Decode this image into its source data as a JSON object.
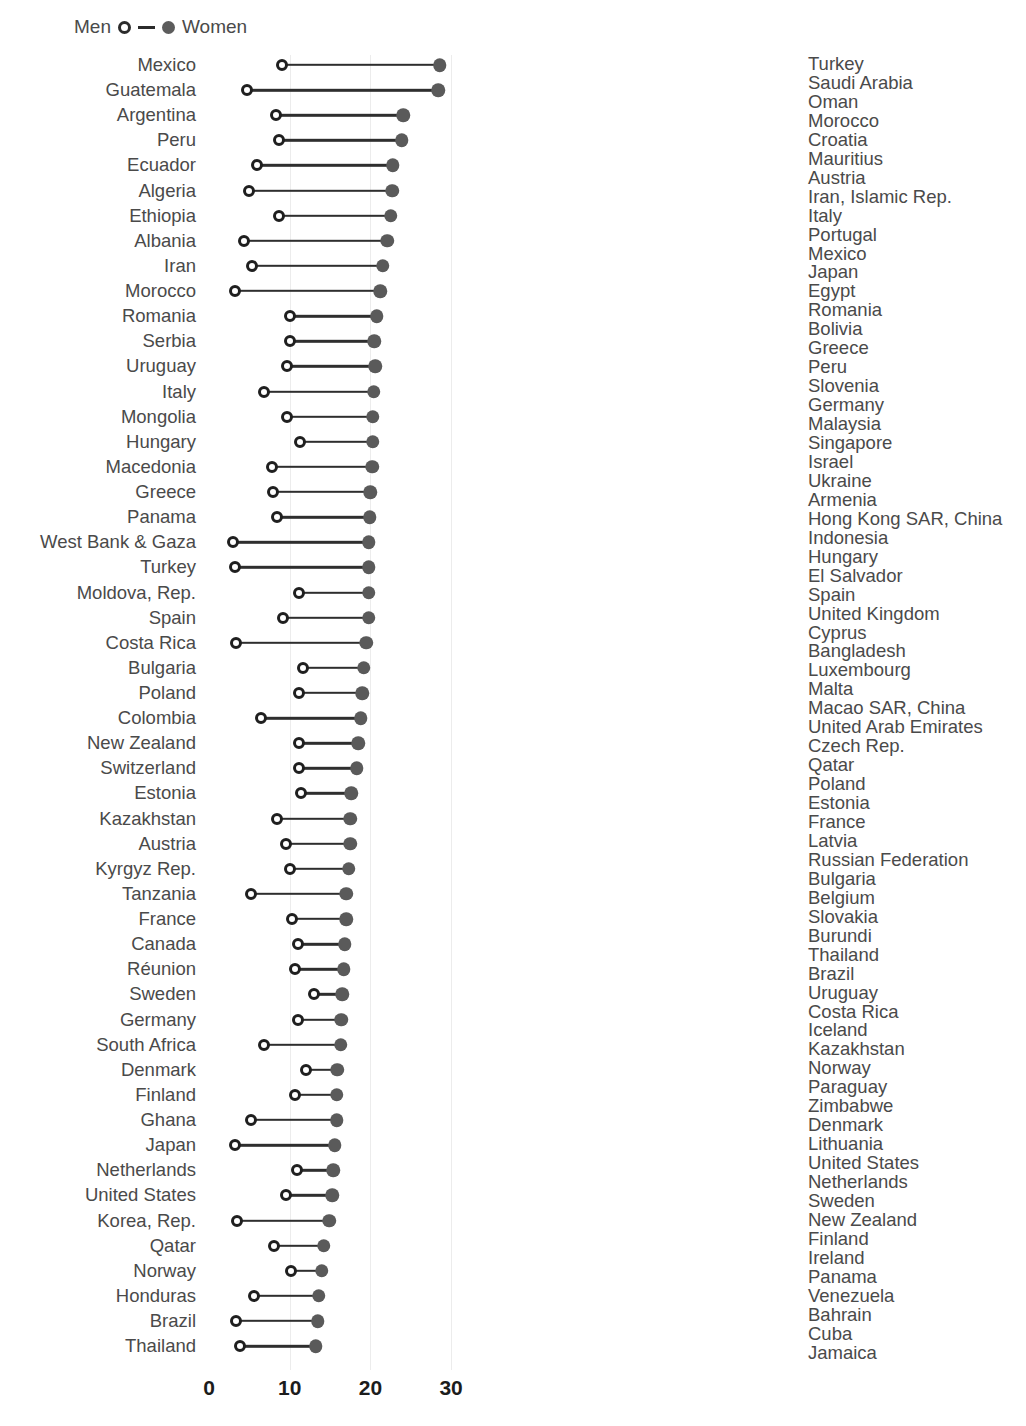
{
  "legend": {
    "men_label": "Men",
    "women_label": "Women",
    "men_icon": "open-circle-icon",
    "women_icon": "filled-circle-icon"
  },
  "colors": {
    "dot_men": "#FFFFFF",
    "dot_men_stroke": "#1F1F1F",
    "dot_women": "#5A5A5A",
    "connector": "#2E2E2E",
    "bar": "#454545",
    "grid": "#ECECEC",
    "text": "#4A4A4A",
    "axis_text": "#1C1C1C",
    "background": "#FFFFFF"
  },
  "chart_data": [
    {
      "id": "dumbbell",
      "type": "scatter",
      "subtype": "dumbbell",
      "title": "",
      "xlabel": "",
      "ylabel": "",
      "xlim": [
        0,
        34
      ],
      "xticks": [
        0,
        10,
        20,
        30
      ],
      "xticklabels": [
        "0",
        "10",
        "20",
        "30"
      ],
      "grid": true,
      "legend": [
        "Men",
        "Women"
      ],
      "legend_position": "top-left",
      "categories": [
        "Mexico",
        "Guatemala",
        "Argentina",
        "Peru",
        "Ecuador",
        "Algeria",
        "Ethiopia",
        "Albania",
        "Iran",
        "Morocco",
        "Romania",
        "Serbia",
        "Uruguay",
        "Italy",
        "Mongolia",
        "Hungary",
        "Macedonia",
        "Greece",
        "Panama",
        "West Bank & Gaza",
        "Turkey",
        "Moldova, Rep.",
        "Spain",
        "Costa Rica",
        "Bulgaria",
        "Poland",
        "Colombia",
        "New Zealand",
        "Switzerland",
        "Estonia",
        "Kazakhstan",
        "Austria",
        "Kyrgyz Rep.",
        "Tanzania",
        "France",
        "Canada",
        "Réunion",
        "Sweden",
        "Germany",
        "South Africa",
        "Denmark",
        "Finland",
        "Ghana",
        "Japan",
        "Netherlands",
        "United States",
        "Korea, Rep.",
        "Qatar",
        "Norway",
        "Honduras",
        "Brazil",
        "Thailand"
      ],
      "series": [
        {
          "name": "Men",
          "marker": "open-circle",
          "values": [
            9.0,
            4.7,
            8.3,
            8.7,
            5.9,
            4.9,
            8.7,
            4.3,
            5.3,
            3.2,
            10.0,
            10.0,
            9.7,
            6.8,
            9.7,
            11.3,
            7.8,
            7.9,
            8.4,
            3.0,
            3.2,
            11.2,
            9.2,
            3.4,
            11.6,
            11.2,
            6.4,
            11.2,
            11.2,
            11.4,
            8.4,
            9.5,
            10.0,
            5.2,
            10.3,
            11.0,
            10.6,
            13.0,
            11.0,
            6.8,
            12.0,
            10.6,
            5.2,
            3.2,
            10.9,
            9.6,
            3.5,
            8.0,
            10.2,
            5.6,
            3.4,
            3.9
          ]
        },
        {
          "name": "Women",
          "marker": "filled-circle",
          "values": [
            28.6,
            28.4,
            24.1,
            23.9,
            22.8,
            22.7,
            22.5,
            22.1,
            21.5,
            21.2,
            20.8,
            20.5,
            20.6,
            20.4,
            20.3,
            20.3,
            20.2,
            20.0,
            19.9,
            19.8,
            19.8,
            19.8,
            19.8,
            19.5,
            19.2,
            19.0,
            18.8,
            18.5,
            18.3,
            17.6,
            17.5,
            17.5,
            17.3,
            17.0,
            17.0,
            16.8,
            16.7,
            16.5,
            16.4,
            16.3,
            15.9,
            15.8,
            15.8,
            15.6,
            15.4,
            15.3,
            14.9,
            14.2,
            14.0,
            13.6,
            13.5,
            13.2
          ]
        }
      ]
    },
    {
      "id": "gap-bars",
      "type": "bar",
      "orientation": "horizontal",
      "title": "",
      "xlabel": "",
      "ylabel": "",
      "xlim": [
        -21,
        12
      ],
      "xticks": [
        -20,
        -10,
        0,
        10
      ],
      "xticklabels": [
        "−20",
        "−10",
        "0",
        "10"
      ],
      "grid": true,
      "categories": [
        "Turkey",
        "Saudi Arabia",
        "Oman",
        "Morocco",
        "Croatia",
        "Mauritius",
        "Austria",
        "Iran, Islamic Rep.",
        "Italy",
        "Portugal",
        "Mexico",
        "Japan",
        "Egypt",
        "Romania",
        "Bolivia",
        "Greece",
        "Peru",
        "Slovenia",
        "Germany",
        "Malaysia",
        "Singapore",
        "Israel",
        "Ukraine",
        "Armenia",
        "Hong Kong SAR, China",
        "Indonesia",
        "Hungary",
        "El Salvador",
        "Spain",
        "United Kingdom",
        "Cyprus",
        "Bangladesh",
        "Luxembourg",
        "Malta",
        "Macao SAR, China",
        "United Arab Emirates",
        "Czech Rep.",
        "Qatar",
        "Poland",
        "Estonia",
        "France",
        "Latvia",
        "Russian Federation",
        "Bulgaria",
        "Belgium",
        "Slovakia",
        "Burundi",
        "Thailand",
        "Brazil",
        "Uruguay",
        "Costa Rica",
        "Iceland",
        "Kazakhstan",
        "Norway",
        "Paraguay",
        "Zimbabwe",
        "Denmark",
        "Lithuania",
        "United States",
        "Netherlands",
        "Sweden",
        "New Zealand",
        "Finland",
        "Ireland",
        "Panama",
        "Venezuela",
        "Bahrain",
        "Cuba",
        "Jamaica"
      ],
      "values": [
        -20.4,
        -16.8,
        -11.2,
        -11.3,
        -9.6,
        -9.3,
        -8.8,
        -8.6,
        -8.2,
        -6.9,
        -6.6,
        -6.2,
        -6.0,
        -5.8,
        -5.6,
        -5.3,
        -5.2,
        -5.1,
        -5.0,
        -4.9,
        -4.8,
        -4.6,
        -4.4,
        -4.3,
        -4.2,
        -4.0,
        -3.9,
        -3.8,
        -3.6,
        -3.5,
        -3.4,
        -3.2,
        -3.1,
        -3.0,
        -2.9,
        -2.8,
        -2.6,
        -2.5,
        -2.4,
        -2.3,
        -2.2,
        -2.0,
        -1.9,
        -1.8,
        -1.6,
        -1.4,
        -1.2,
        -1.0,
        -0.8,
        -0.7,
        -0.5,
        -0.4,
        -0.3,
        -0.2,
        -0.1,
        0.1,
        0.2,
        0.4,
        0.7,
        0.8,
        1.0,
        1.2,
        1.4,
        2.2,
        2.6,
        3.0,
        3.8,
        4.8,
        7.8
      ]
    }
  ]
}
